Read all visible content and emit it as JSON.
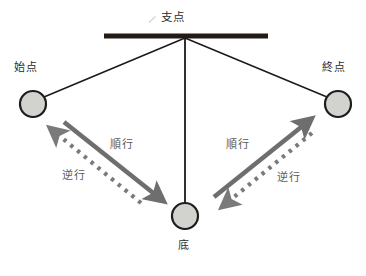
{
  "diagram": {
    "title_label": "支点",
    "labels": {
      "fulcrum": "支点",
      "start_point": "始点",
      "end_point": "終点",
      "bottom": "底",
      "forward_left": "順行",
      "reverse_left": "逆行",
      "forward_right": "順行",
      "reverse_right": "逆行"
    },
    "icons": {
      "tick_mark": "slash-tick-icon",
      "bob_start": "pendulum-bob-icon",
      "bob_end": "pendulum-bob-icon",
      "bob_bottom": "pendulum-bob-icon",
      "arrow_forward_left": "arrow-down-right-icon",
      "arrow_reverse_left": "dashed-arrow-up-left-icon",
      "arrow_forward_right": "arrow-up-right-icon",
      "arrow_reverse_right": "dashed-arrow-down-left-icon",
      "support_bar": "horizontal-support-bar-icon"
    },
    "colors": {
      "background": "#ffffff",
      "support_bar": "#241a15",
      "string": "#1a1a1a",
      "bob_fill": "#d2d2ce",
      "bob_stroke": "#1c1c1c",
      "arrow_solid": "#6e6e6e",
      "arrow_dashed": "#7a7a7a",
      "text": "#3b3b3b"
    },
    "geometry": {
      "fulcrum": {
        "x": 185,
        "y": 38
      },
      "support_bar": {
        "x1": 104,
        "x2": 268,
        "y": 36,
        "thickness": 5
      },
      "bob_start": {
        "cx": 33,
        "cy": 104,
        "r": 13
      },
      "bob_end": {
        "cx": 338,
        "cy": 104,
        "r": 13
      },
      "bob_bottom": {
        "cx": 185,
        "cy": 216,
        "r": 13
      }
    }
  }
}
